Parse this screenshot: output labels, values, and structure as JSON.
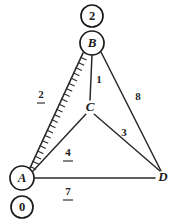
{
  "figure": {
    "type": "weighted-undirected-graph",
    "background_color": "#ffffff",
    "stroke_color": "#1b1b1b",
    "width": 178,
    "height": 224
  },
  "nodes": [
    {
      "id": "B",
      "label": "B",
      "shape": "circle",
      "x": 92,
      "y": 43,
      "r": 12,
      "style": "italic-serif"
    },
    {
      "id": "C",
      "label": "C",
      "shape": "plain",
      "x": 90,
      "y": 108,
      "r": 0,
      "style": "italic-serif"
    },
    {
      "id": "A",
      "label": "A",
      "shape": "circle",
      "x": 22,
      "y": 178,
      "r": 12,
      "style": "italic-serif"
    },
    {
      "id": "D",
      "label": "D",
      "shape": "plain",
      "x": 163,
      "y": 178,
      "r": 0,
      "style": "italic-serif"
    }
  ],
  "value_badges": [
    {
      "id": "badge-b",
      "label": "2",
      "attached_to": "B",
      "shape": "circle",
      "x": 92,
      "y": 16,
      "r": 11
    },
    {
      "id": "badge-a",
      "label": "0",
      "attached_to": "A",
      "shape": "circle",
      "x": 22,
      "y": 207,
      "r": 11
    }
  ],
  "edges": [
    {
      "id": "edge-a-b",
      "from": "A",
      "to": "B",
      "weight": "2",
      "marked": true,
      "hatched": true,
      "label_x": 41,
      "label_y": 95,
      "label_underlined": true
    },
    {
      "id": "edge-b-c",
      "from": "B",
      "to": "C",
      "weight": "1",
      "marked": false,
      "hatched": false,
      "label_x": 99,
      "label_y": 80,
      "label_underlined": false
    },
    {
      "id": "edge-b-d",
      "from": "B",
      "to": "D",
      "weight": "8",
      "marked": false,
      "hatched": false,
      "label_x": 138,
      "label_y": 97,
      "label_underlined": false
    },
    {
      "id": "edge-c-a",
      "from": "C",
      "to": "A",
      "weight": "4",
      "marked": false,
      "hatched": false,
      "label_x": 68,
      "label_y": 153,
      "label_underlined": true
    },
    {
      "id": "edge-c-d",
      "from": "C",
      "to": "D",
      "weight": "3",
      "marked": false,
      "hatched": false,
      "label_x": 124,
      "label_y": 133,
      "label_underlined": false
    },
    {
      "id": "edge-a-d",
      "from": "A",
      "to": "D",
      "weight": "7",
      "marked": false,
      "hatched": false,
      "label_x": 68,
      "label_y": 192,
      "label_underlined": true
    }
  ]
}
